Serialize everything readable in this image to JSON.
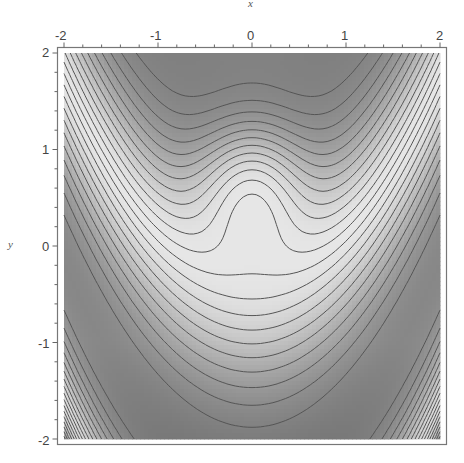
{
  "chart_data": {
    "type": "contour",
    "title": "",
    "xlabel": "x",
    "ylabel": "y",
    "xlim": [
      -2,
      2
    ],
    "ylim": [
      -2,
      2
    ],
    "x_ticks": [
      "-2",
      "-1",
      "0",
      "1",
      "2"
    ],
    "y_ticks": [
      "2",
      "1",
      "0",
      "-1",
      "-2"
    ],
    "minor_tick_step": 0.2,
    "grid": false,
    "legend": null,
    "colormap": "grayscale",
    "contour_count": 22,
    "features": {
      "local_minimum": {
        "x": 0,
        "y": 0.6,
        "description": "closed oval contour"
      },
      "light_band": "U-shaped bright band from upper-left (-2,1.3) through (0,-0.3) to upper-right (2,1.3)",
      "dark_regions": [
        "top-center (around x=0, y=1..2)",
        "bottom (y < -1)"
      ]
    },
    "shade_colors": {
      "dark": "#6e6e6e",
      "mid": "#8c8c8c",
      "light": "#e0e0e0"
    },
    "contour_color": "#555555"
  },
  "axes": {
    "x_label": "x",
    "y_label": "y",
    "x_tick_labels": [
      "-2",
      "-1",
      "0",
      "1",
      "2"
    ],
    "y_tick_labels": [
      "2",
      "1",
      "0",
      "-1",
      "-2"
    ]
  }
}
